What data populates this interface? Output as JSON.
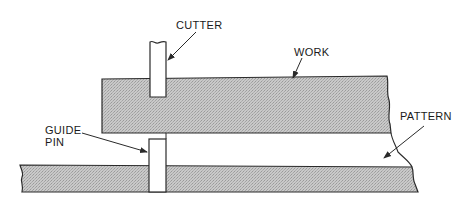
{
  "diagram": {
    "type": "technical-illustration",
    "labels": {
      "cutter": "CUTTER",
      "work": "WORK",
      "pattern": "PATTERN",
      "guide_pin_line1": "GUIDE",
      "guide_pin_line2": "PIN"
    },
    "colors": {
      "line": "#2a2a2a",
      "hatch_fill": "#bdbdbd",
      "background": "#ffffff"
    },
    "components": [
      {
        "name": "cutter",
        "label": "CUTTER"
      },
      {
        "name": "work",
        "label": "WORK"
      },
      {
        "name": "guide-pin",
        "label": "GUIDE PIN"
      },
      {
        "name": "pattern",
        "label": "PATTERN"
      }
    ]
  }
}
